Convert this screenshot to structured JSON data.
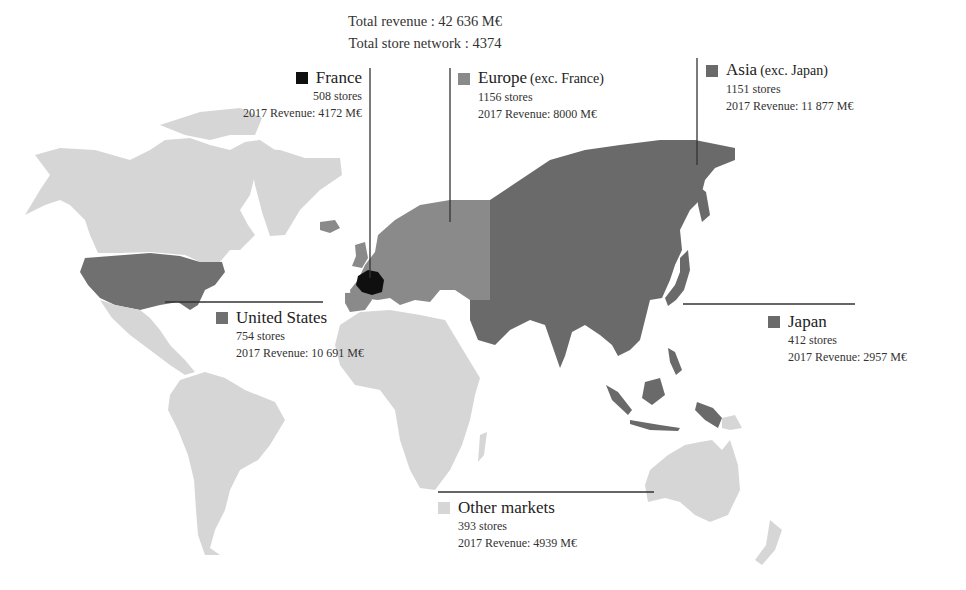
{
  "totals": {
    "revenue_label": "Total revenue : 42 636 M€",
    "stores_label": "Total store network : 4374"
  },
  "colors": {
    "france": "#0f0f0f",
    "europe": "#8a8a8a",
    "united_states": "#707070",
    "asia": "#6a6a6a",
    "japan": "#6a6a6a",
    "other": "#d6d6d6",
    "leader_line": "#333333"
  },
  "regions": {
    "france": {
      "name": "France",
      "stores": "508 stores",
      "revenue": "2017 Revenue: 4172 M€"
    },
    "europe": {
      "name": "Europe",
      "qualifier": "(exc. France)",
      "stores": "1156 stores",
      "revenue": "2017 Revenue: 8000 M€"
    },
    "asia": {
      "name": "Asia",
      "qualifier": "(exc. Japan)",
      "stores": "1151 stores",
      "revenue": "2017 Revenue: 11 877 M€"
    },
    "united_states": {
      "name": "United States",
      "stores": "754 stores",
      "revenue": "2017 Revenue: 10 691 M€"
    },
    "japan": {
      "name": "Japan",
      "stores": "412 stores",
      "revenue": "2017 Revenue: 2957 M€"
    },
    "other": {
      "name": "Other markets",
      "stores": "393 stores",
      "revenue": "2017 Revenue: 4939 M€"
    }
  }
}
